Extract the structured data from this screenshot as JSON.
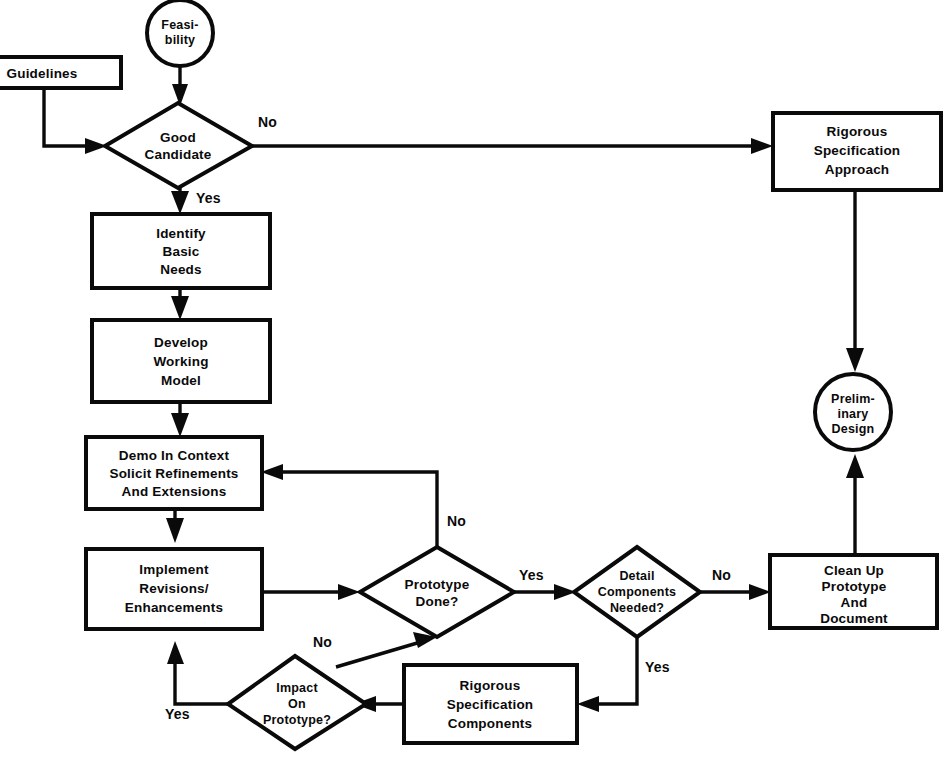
{
  "diagram": {
    "type": "flowchart",
    "canvas": {
      "width": 947,
      "height": 757
    },
    "colors": {
      "stroke": "#0a0a0a",
      "fill": "#ffffff",
      "background": "#ffffff"
    }
  },
  "nodes": {
    "feasibility": {
      "shape": "circle",
      "lines": [
        "Feasi-",
        "bility"
      ]
    },
    "guidelines": {
      "shape": "rect",
      "lines": [
        "Guidelines"
      ]
    },
    "good_candidate": {
      "shape": "diamond",
      "lines": [
        "Good",
        "Candidate"
      ]
    },
    "identify_basic_needs": {
      "shape": "rect",
      "lines": [
        "Identify",
        "Basic",
        "Needs"
      ]
    },
    "develop_working_model": {
      "shape": "rect",
      "lines": [
        "Develop",
        "Working",
        "Model"
      ]
    },
    "demo_in_context": {
      "shape": "rect",
      "lines": [
        "Demo In Context",
        "Solicit Refinements",
        "And Extensions"
      ]
    },
    "implement_revisions": {
      "shape": "rect",
      "lines": [
        "Implement",
        "Revisions/",
        "Enhancements"
      ]
    },
    "prototype_done": {
      "shape": "diamond",
      "lines": [
        "Prototype",
        "Done?"
      ]
    },
    "impact_on_prototype": {
      "shape": "diamond",
      "lines": [
        "Impact",
        "On",
        "Prototype?"
      ]
    },
    "rigorous_spec_components": {
      "shape": "rect",
      "lines": [
        "Rigorous",
        "Specification",
        "Components"
      ]
    },
    "detail_components_needed": {
      "shape": "diamond",
      "lines": [
        "Detail",
        "Components",
        "Needed?"
      ]
    },
    "clean_up_prototype": {
      "shape": "rect",
      "lines": [
        "Clean Up",
        "Prototype",
        "And",
        "Document"
      ]
    },
    "rigorous_spec_approach": {
      "shape": "rect",
      "lines": [
        "Rigorous",
        "Specification",
        "Approach"
      ]
    },
    "preliminary_design": {
      "shape": "circle",
      "lines": [
        "Prelim-",
        "inary",
        "Design"
      ]
    }
  },
  "edge_labels": {
    "good_candidate_no": "No",
    "good_candidate_yes": "Yes",
    "prototype_done_no": "No",
    "prototype_done_yes": "Yes",
    "detail_components_no": "No",
    "detail_components_yes": "Yes",
    "impact_no": "No",
    "impact_yes": "Yes"
  },
  "edges": [
    {
      "from": "feasibility",
      "to": "good_candidate",
      "label": ""
    },
    {
      "from": "guidelines",
      "to": "good_candidate",
      "label": ""
    },
    {
      "from": "good_candidate",
      "to": "rigorous_spec_approach",
      "label": "No"
    },
    {
      "from": "good_candidate",
      "to": "identify_basic_needs",
      "label": "Yes"
    },
    {
      "from": "identify_basic_needs",
      "to": "develop_working_model",
      "label": ""
    },
    {
      "from": "develop_working_model",
      "to": "demo_in_context",
      "label": ""
    },
    {
      "from": "demo_in_context",
      "to": "implement_revisions",
      "label": ""
    },
    {
      "from": "implement_revisions",
      "to": "prototype_done",
      "label": ""
    },
    {
      "from": "prototype_done",
      "to": "demo_in_context",
      "label": "No"
    },
    {
      "from": "prototype_done",
      "to": "detail_components_needed",
      "label": "Yes"
    },
    {
      "from": "detail_components_needed",
      "to": "clean_up_prototype",
      "label": "No"
    },
    {
      "from": "detail_components_needed",
      "to": "rigorous_spec_components",
      "label": "Yes"
    },
    {
      "from": "rigorous_spec_components",
      "to": "impact_on_prototype",
      "label": ""
    },
    {
      "from": "impact_on_prototype",
      "to": "prototype_done",
      "label": "No"
    },
    {
      "from": "impact_on_prototype",
      "to": "implement_revisions",
      "label": "Yes"
    },
    {
      "from": "rigorous_spec_approach",
      "to": "preliminary_design",
      "label": ""
    },
    {
      "from": "clean_up_prototype",
      "to": "preliminary_design",
      "label": ""
    }
  ]
}
